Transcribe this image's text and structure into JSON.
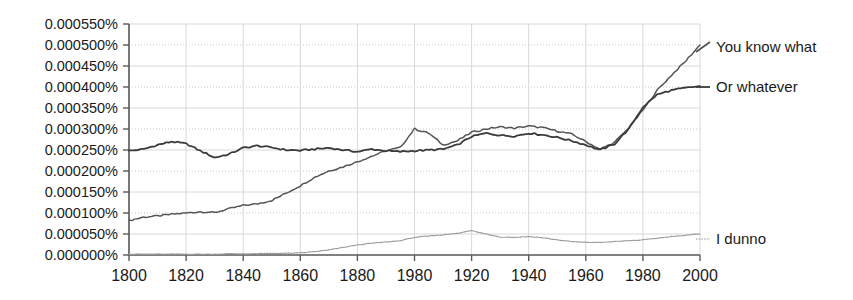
{
  "chart_data": {
    "type": "line",
    "title": "",
    "subtitle": "",
    "xlabel": "",
    "ylabel": "",
    "xlim": [
      1800,
      2000
    ],
    "ylim": [
      0.0,
      0.00055
    ],
    "grid": true,
    "legend_position": "right-inline",
    "x_ticks": [
      "1800",
      "1820",
      "1840",
      "1860",
      "1880",
      "1980",
      "1920",
      "1940",
      "1960",
      "1980",
      "2000"
    ],
    "x_tick_values": [
      1800,
      1820,
      1840,
      1860,
      1880,
      1900,
      1920,
      1940,
      1960,
      1980,
      2000
    ],
    "y_ticks": [
      "0.000550%",
      "0.000500%",
      "0.000450%",
      "0.000400%",
      "0.000350%",
      "0.000300%",
      "0.000250%",
      "0.000200%",
      "0.000150%",
      "0.000100%",
      "0.000050%",
      "0.000000%"
    ],
    "y_tick_values": [
      0.00055,
      0.0005,
      0.00045,
      0.0004,
      0.00035,
      0.0003,
      0.00025,
      0.0002,
      0.00015,
      0.0001,
      5e-05,
      0.0
    ],
    "x": [
      1800,
      1805,
      1810,
      1815,
      1820,
      1825,
      1830,
      1835,
      1840,
      1845,
      1850,
      1855,
      1860,
      1865,
      1870,
      1875,
      1880,
      1885,
      1890,
      1895,
      1900,
      1905,
      1910,
      1915,
      1920,
      1925,
      1930,
      1935,
      1940,
      1945,
      1950,
      1955,
      1960,
      1965,
      1970,
      1975,
      1980,
      1985,
      1990,
      1995,
      2000
    ],
    "series": [
      {
        "name": "You know what",
        "color": "#555555",
        "width": 1.5,
        "values": [
          8.2e-05,
          9e-05,
          9.3e-05,
          9.7e-05,
          0.0001,
          0.000103,
          0.000101,
          0.00011,
          0.000118,
          0.000122,
          0.00013,
          0.000147,
          0.000165,
          0.000185,
          0.0002,
          0.00021,
          0.000222,
          0.000235,
          0.000248,
          0.000256,
          0.0003,
          0.00029,
          0.000262,
          0.000272,
          0.000292,
          0.0003,
          0.000305,
          0.000302,
          0.000307,
          0.000303,
          0.000295,
          0.000288,
          0.00027,
          0.000252,
          0.000268,
          0.000302,
          0.000345,
          0.000392,
          0.000428,
          0.000462,
          0.0005
        ]
      },
      {
        "name": "Or whatever",
        "color": "#3a3a3a",
        "width": 1.8,
        "values": [
          0.000248,
          0.000252,
          0.000262,
          0.00027,
          0.000265,
          0.000248,
          0.000232,
          0.00024,
          0.000255,
          0.00026,
          0.000256,
          0.00025,
          0.000249,
          0.000252,
          0.000255,
          0.00025,
          0.000246,
          0.000252,
          0.000248,
          0.000246,
          0.000248,
          0.00025,
          0.000252,
          0.000262,
          0.000282,
          0.00029,
          0.000285,
          0.000283,
          0.00029,
          0.000286,
          0.00028,
          0.000272,
          0.000262,
          0.00025,
          0.000264,
          0.0003,
          0.000352,
          0.000382,
          0.000392,
          0.000398,
          0.000402
        ]
      },
      {
        "name": "I dunno",
        "color": "#9a9a9a",
        "width": 1.2,
        "values": [
          2e-06,
          2e-06,
          2e-06,
          2e-06,
          2e-06,
          2e-06,
          2e-06,
          3e-06,
          3e-06,
          3e-06,
          4e-06,
          4e-06,
          5e-06,
          8e-06,
          1.2e-05,
          1.8e-05,
          2.4e-05,
          2.8e-05,
          3.1e-05,
          3.4e-05,
          4.2e-05,
          4.5e-05,
          4.8e-05,
          5.2e-05,
          5.8e-05,
          5e-05,
          4.3e-05,
          4.2e-05,
          4.4e-05,
          4.1e-05,
          3.6e-05,
          3.2e-05,
          3e-05,
          3e-05,
          3.2e-05,
          3.4e-05,
          3.6e-05,
          4e-05,
          4.4e-05,
          4.7e-05,
          5e-05
        ]
      }
    ],
    "legend_entries": [
      {
        "label": "You know what",
        "color": "#555555",
        "marker": "rising-line"
      },
      {
        "label": "Or whatever",
        "color": "#3a3a3a",
        "marker": "flat-line"
      },
      {
        "label": "I dunno",
        "color": "#9a9a9a",
        "marker": "dotted-line"
      }
    ]
  }
}
